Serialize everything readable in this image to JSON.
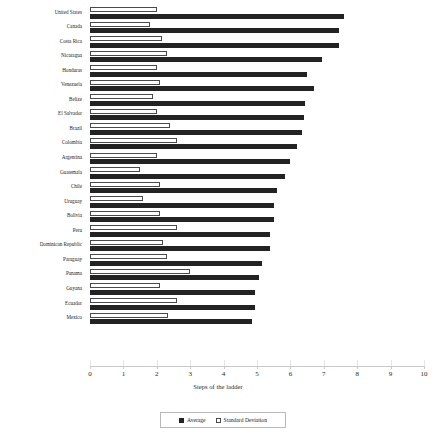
{
  "chart": {
    "type": "bar",
    "title": "",
    "xlabel": "Steps of the ladder",
    "ylabel": "",
    "orientation": "horizontal",
    "xlim": [
      0,
      10
    ],
    "grid": false,
    "legend_position": "bottom-center"
  },
  "axis": {
    "ticks": [
      "0",
      "1",
      "2",
      "3",
      "4",
      "5",
      "6",
      "7",
      "8",
      "9",
      "10"
    ]
  },
  "legend": {
    "average_label": "Average",
    "sd_label": "Standard Deviation",
    "average_color": "#232323",
    "sd_color": "#ffffff",
    "sd_border_color": "#4a4a4a"
  },
  "chart_data": {
    "type": "bar",
    "orientation": "horizontal",
    "title": "",
    "xlabel": "Steps of the ladder",
    "ylabel": "",
    "xlim": [
      0,
      10
    ],
    "grid": false,
    "legend": [
      "Average",
      "Standard Deviation"
    ],
    "legend_position": "bottom-center",
    "categories": [
      "United States",
      "Canada",
      "Costa Rica",
      "Nicaragua",
      "Honduras",
      "Venezuela",
      "Belize",
      "El Salvador",
      "Brazil",
      "Colombia",
      "Argentina",
      "Guatemala",
      "Chile",
      "Uruguay",
      "Bolivia",
      "Peru",
      "Dominican Republic",
      "Paraguay",
      "Panama",
      "Guyana",
      "Ecuador",
      "Mexico"
    ],
    "series": [
      {
        "name": "Average",
        "values": [
          7.6,
          7.45,
          7.45,
          6.95,
          6.5,
          6.7,
          6.45,
          6.4,
          6.35,
          6.2,
          6.0,
          5.85,
          5.6,
          5.5,
          5.5,
          5.4,
          5.4,
          5.15,
          5.05,
          4.95,
          4.95,
          4.85
        ]
      },
      {
        "name": "Standard Deviation",
        "values": [
          2.0,
          1.8,
          2.15,
          2.3,
          2.0,
          2.1,
          1.9,
          2.0,
          2.4,
          2.6,
          2.0,
          1.5,
          2.1,
          1.6,
          2.1,
          2.6,
          2.2,
          2.3,
          3.0,
          2.1,
          2.6,
          2.35
        ]
      }
    ]
  }
}
